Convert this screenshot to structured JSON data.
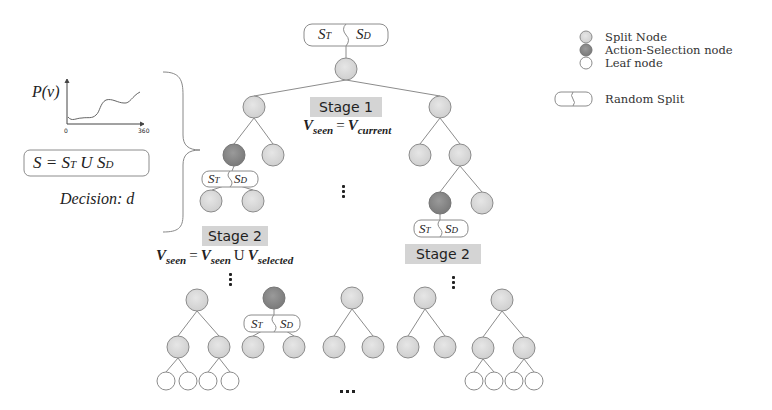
{
  "legend": {
    "items": [
      {
        "label": "Split Node",
        "color": "#d6d6d6"
      },
      {
        "label": "Action-Selection node",
        "color": "#8a8a8a"
      },
      {
        "label": "Leaf node",
        "color": "#ffffff"
      },
      {
        "label": "Random Split",
        "icon": "random-split-box"
      }
    ]
  },
  "left_panel": {
    "plot_ylabel": "P(v)",
    "plot_xmin": "0",
    "plot_xmax": "360",
    "set_equation": "S = S",
    "set_T": "T",
    "set_union": " U S",
    "set_D": "D",
    "decision": "Decision: d"
  },
  "split_box": {
    "left": "S",
    "left_sub": "T",
    "right": "S",
    "right_sub": "D"
  },
  "stages": {
    "stage1": {
      "label": "Stage 1",
      "eq_lhs": "V",
      "eq_lhs_sub": "seen",
      "eq_op": "=",
      "eq_rhs": "V",
      "eq_rhs_sub": "current"
    },
    "stage2_left": {
      "label": "Stage 2",
      "eq_lhs": "V",
      "eq_lhs_sub": "seen",
      "eq_op": "=",
      "eq_rhs1": "V",
      "eq_rhs1_sub": "seen",
      "eq_union": "U",
      "eq_rhs2": "V",
      "eq_rhs2_sub": "selected"
    },
    "stage2_right": {
      "label": "Stage 2"
    }
  },
  "colors": {
    "split_node": "#d6d6d6",
    "action_node": "#8a8a8a",
    "leaf_node": "#ffffff",
    "stroke": "#8c8c8c",
    "stage_bg": "#d4d4d4"
  }
}
